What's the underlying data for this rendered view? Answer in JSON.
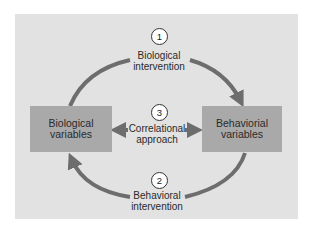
{
  "diagram": {
    "nodes": [
      {
        "id": "bio",
        "label_line1": "Biological",
        "label_line2": "variables"
      },
      {
        "id": "beh",
        "label_line1": "Behaviorial",
        "label_line2": "variables"
      }
    ],
    "approaches": [
      {
        "number": "1",
        "line1": "Biological",
        "line2": "intervention",
        "from": "bio",
        "to": "beh"
      },
      {
        "number": "2",
        "line1": "Behavioral",
        "line2": "intervention",
        "from": "beh",
        "to": "bio"
      },
      {
        "number": "3",
        "line1": "Correlational",
        "line2": "approach",
        "from": "bio",
        "to": "beh",
        "bidirectional": true
      }
    ],
    "colors": {
      "panel": "#e2e2e2",
      "box": "#a9a9a9",
      "arrow": "#6d6d6d"
    }
  }
}
